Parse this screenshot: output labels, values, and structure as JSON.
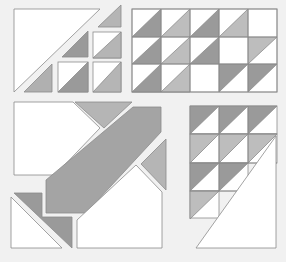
{
  "colors": {
    "background": "#f1f1f1",
    "white": "#ffffff",
    "dark": "#9a9a9a",
    "light": "#bdbdbd",
    "mid": "#a8a8a8",
    "stroke": "#8c8c8c"
  },
  "blocks": [
    {
      "id": "top-left",
      "description": "Large white half-square triangle with staircase of small half-square triangles"
    },
    {
      "id": "top-right",
      "description": "5x3 grid of half-square triangles"
    },
    {
      "id": "bottom-left",
      "description": "Diagonal band block with corner pieces"
    },
    {
      "id": "bottom-right",
      "description": "3-column staircase of half-square triangles with large white triangle"
    }
  ],
  "top_right_grid": {
    "cols": 5,
    "rows": 3,
    "cells": [
      [
        "dark",
        "light",
        "dark",
        "light",
        "empty"
      ],
      [
        "dark",
        "light",
        "dark",
        "empty",
        "light-ul"
      ],
      [
        "dark",
        "light",
        "empty",
        "dark-ul",
        "dark-ul"
      ]
    ]
  },
  "bottom_right_grid": {
    "cols": 3,
    "rows": [
      [
        "dark-ul",
        "dark-ul",
        "dark-ul"
      ],
      [
        "light-ul",
        "light-ul",
        "light-ul"
      ],
      [
        "dark-ul",
        "dark-ul"
      ],
      [
        "light-ul"
      ]
    ]
  }
}
